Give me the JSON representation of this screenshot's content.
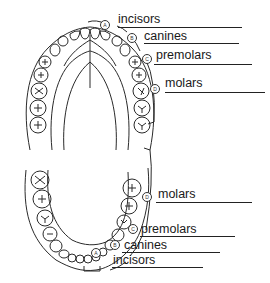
{
  "diagram": {
    "upper_arch": {
      "labels": [
        {
          "key": "A",
          "text": "incisors"
        },
        {
          "key": "B",
          "text": "canines"
        },
        {
          "key": "C",
          "text": "premolars"
        },
        {
          "key": "D",
          "text": "molars"
        }
      ]
    },
    "lower_arch": {
      "labels": [
        {
          "key": "D",
          "text": "molars"
        },
        {
          "key": "C",
          "text": "premolars"
        },
        {
          "key": "B",
          "text": "canines"
        },
        {
          "key": "A",
          "text": "incisors"
        }
      ]
    },
    "colors": {
      "ink": "#222222",
      "background": "#ffffff"
    }
  }
}
